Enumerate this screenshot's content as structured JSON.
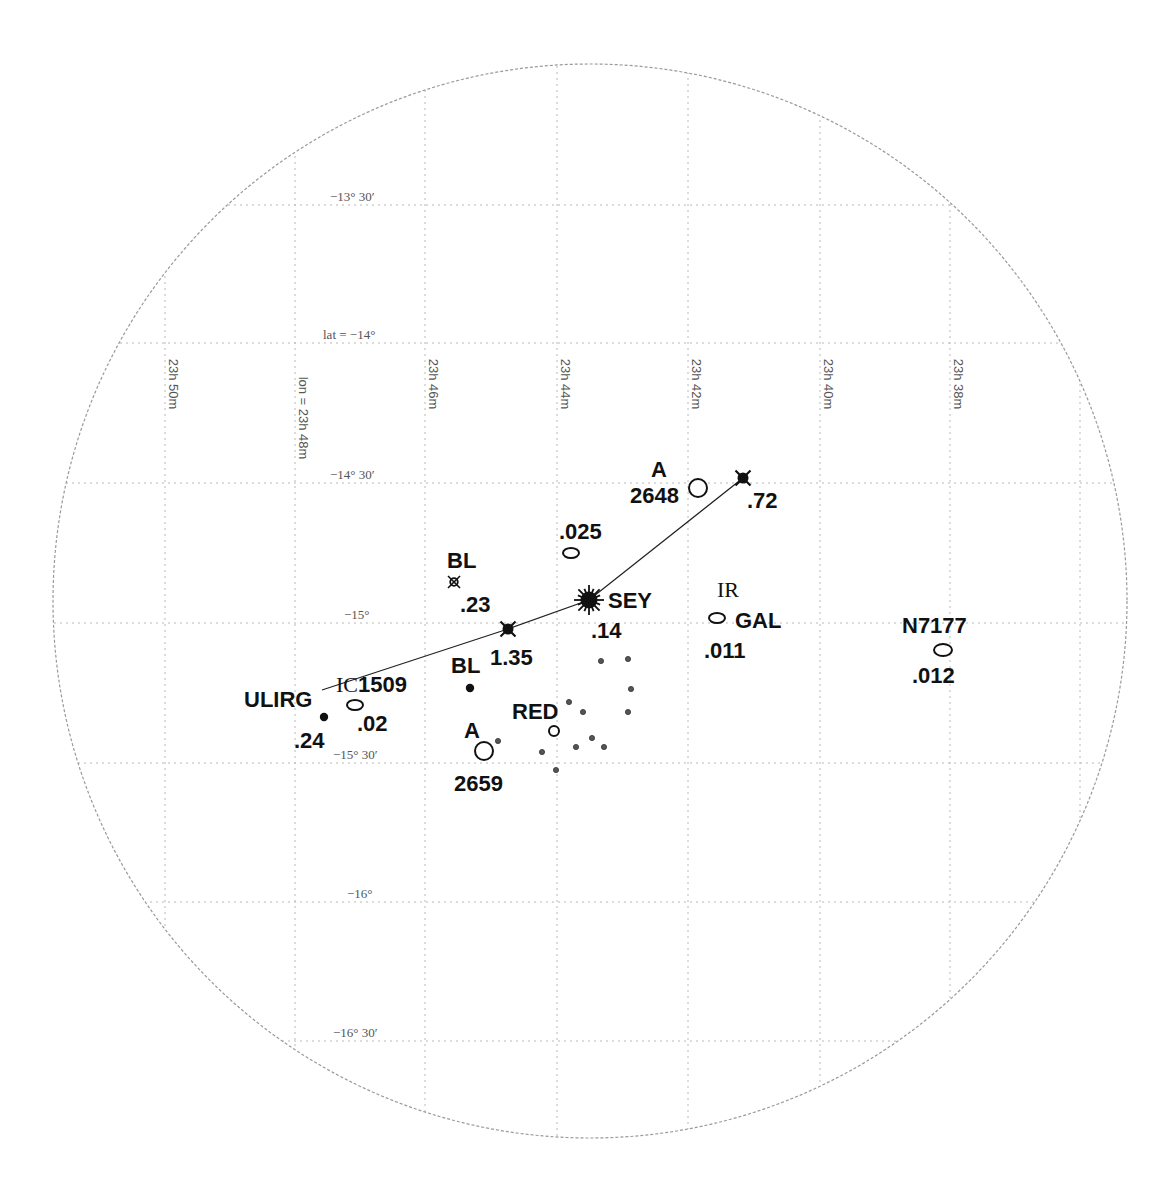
{
  "chart_data": {
    "type": "scatter",
    "title": "",
    "projection": "circular sky field, RA (lon) vs Dec (lat)",
    "field": {
      "cx": 590,
      "cy": 601,
      "r": 537
    },
    "grid": {
      "on": true,
      "lat_lines": [
        {
          "y": 205,
          "label": "−13° 30′",
          "label_x": 330
        },
        {
          "y": 343,
          "label": "lat = −14°",
          "label_x": 323
        },
        {
          "y": 483,
          "label": "−14° 30′",
          "label_x": 330
        },
        {
          "y": 623,
          "label": "−15°",
          "label_x": 344
        },
        {
          "y": 763,
          "label": "−15° 30′",
          "label_x": 333
        },
        {
          "y": 902,
          "label": "−16°",
          "label_x": 347
        },
        {
          "y": 1041,
          "label": "−16° 30′",
          "label_x": 333
        }
      ],
      "lon_lines": [
        {
          "x": 165,
          "label": "23h 50m"
        },
        {
          "x": 295,
          "label": "lon = 23h 48m"
        },
        {
          "x": 425,
          "label": "23h 46m"
        },
        {
          "x": 557,
          "label": "23h 44m"
        },
        {
          "x": 688,
          "label": "23h 42m"
        },
        {
          "x": 820,
          "label": "23h 40m"
        },
        {
          "x": 950,
          "label": "23h 38m"
        },
        {
          "x": 1080,
          "label": "23h 36m"
        }
      ]
    },
    "chain_line": [
      [
        322,
        690
      ],
      [
        508,
        629
      ],
      [
        589,
        600
      ],
      [
        743,
        478
      ]
    ],
    "objects": [
      {
        "id": "qso-072",
        "kind": "qso",
        "symbol": "filled-x",
        "x": 743,
        "y": 478,
        "labels": [
          {
            "text": ".72",
            "x": 747,
            "y": 508
          }
        ]
      },
      {
        "id": "qso-135",
        "kind": "qso",
        "symbol": "filled-x",
        "x": 508,
        "y": 629,
        "labels": [
          {
            "text": "1.35",
            "x": 490,
            "y": 665
          }
        ]
      },
      {
        "id": "seyfert",
        "kind": "seyfert",
        "symbol": "burst",
        "x": 589,
        "y": 600,
        "labels": [
          {
            "text": "SEY",
            "x": 608,
            "y": 608
          },
          {
            "text": ".14",
            "x": 591,
            "y": 638
          }
        ]
      },
      {
        "id": "bl-023",
        "kind": "bl-lac",
        "symbol": "open-x",
        "x": 454,
        "y": 582,
        "labels": [
          {
            "text": "BL",
            "x": 447,
            "y": 568
          },
          {
            "text": ".23",
            "x": 460,
            "y": 612
          }
        ]
      },
      {
        "id": "bl-dot",
        "kind": "bl-lac",
        "symbol": "dot",
        "x": 470,
        "y": 688,
        "labels": [
          {
            "text": "BL",
            "x": 451,
            "y": 673
          }
        ]
      },
      {
        "id": "gal-025",
        "kind": "galaxy",
        "symbol": "ellipse",
        "x": 571,
        "y": 553,
        "rx": 8,
        "ry": 5,
        "labels": [
          {
            "text": ".025",
            "x": 559,
            "y": 539
          }
        ]
      },
      {
        "id": "abell-2648",
        "kind": "cluster",
        "symbol": "circle",
        "x": 698,
        "y": 488,
        "r": 9,
        "labels": [
          {
            "text": "A",
            "x": 651,
            "y": 477
          },
          {
            "text": "2648",
            "x": 630,
            "y": 503
          }
        ]
      },
      {
        "id": "abell-2659",
        "kind": "cluster",
        "symbol": "circle",
        "x": 484,
        "y": 751,
        "r": 9,
        "labels": [
          {
            "text": "A",
            "x": 464,
            "y": 738
          },
          {
            "text": "2659",
            "x": 454,
            "y": 791
          }
        ]
      },
      {
        "id": "ic1509",
        "kind": "galaxy",
        "symbol": "ellipse",
        "x": 355,
        "y": 705,
        "rx": 8,
        "ry": 5,
        "labels": [
          {
            "text": "IC1509",
            "x": 336,
            "y": 692,
            "serif_prefix": true
          },
          {
            "text": ".02",
            "x": 357,
            "y": 731
          }
        ]
      },
      {
        "id": "ulirg",
        "kind": "ulirg",
        "symbol": "dot",
        "x": 324,
        "y": 717,
        "labels": [
          {
            "text": "ULIRG",
            "x": 244,
            "y": 707
          },
          {
            "text": ".24",
            "x": 294,
            "y": 748
          }
        ]
      },
      {
        "id": "red",
        "kind": "red-galaxy",
        "symbol": "small-circle",
        "x": 554,
        "y": 731,
        "r": 5,
        "labels": [
          {
            "text": "RED",
            "x": 512,
            "y": 719
          }
        ]
      },
      {
        "id": "ir-gal",
        "kind": "ir-galaxy",
        "symbol": "ellipse",
        "x": 717,
        "y": 618,
        "rx": 8,
        "ry": 5,
        "labels": [
          {
            "text": "IR",
            "x": 717,
            "y": 597,
            "serif": true
          },
          {
            "text": "GAL",
            "x": 735,
            "y": 628
          },
          {
            "text": ".011",
            "x": 704,
            "y": 658
          }
        ]
      },
      {
        "id": "n7177",
        "kind": "galaxy",
        "symbol": "ellipse",
        "x": 943,
        "y": 650,
        "rx": 9,
        "ry": 6,
        "labels": [
          {
            "text": "N7177",
            "x": 902,
            "y": 633
          },
          {
            "text": ".012",
            "x": 912,
            "y": 683
          }
        ]
      }
    ],
    "small_dots": [
      [
        601,
        661
      ],
      [
        628,
        659
      ],
      [
        631,
        689
      ],
      [
        569,
        702
      ],
      [
        583,
        712
      ],
      [
        628,
        712
      ],
      [
        498,
        741
      ],
      [
        592,
        738
      ],
      [
        542,
        752
      ],
      [
        576,
        747
      ],
      [
        604,
        747
      ],
      [
        556,
        770
      ]
    ],
    "xlabel": "lon (RA)",
    "ylabel": "lat (Dec)"
  }
}
